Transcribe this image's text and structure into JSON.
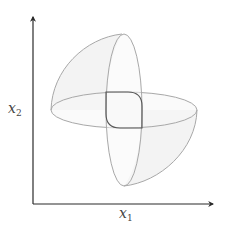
{
  "diagram": {
    "title": "",
    "axes": {
      "x": {
        "label_base": "x",
        "label_sub": "1"
      },
      "y": {
        "label_base": "x",
        "label_sub": "2"
      }
    },
    "colors": {
      "axis": "#2b2b2b",
      "outline": "#a8a8a8",
      "inner_curve": "#555555",
      "fill": "#f2f2f2"
    },
    "shapes": [
      {
        "name": "horizontal-ellipse",
        "type": "ellipse"
      },
      {
        "name": "vertical-ellipse",
        "type": "ellipse"
      },
      {
        "name": "upper-left-quarter-surface",
        "type": "surface"
      },
      {
        "name": "lower-right-quarter-surface",
        "type": "surface"
      },
      {
        "name": "intersection-rounded-square",
        "type": "curve"
      }
    ]
  }
}
